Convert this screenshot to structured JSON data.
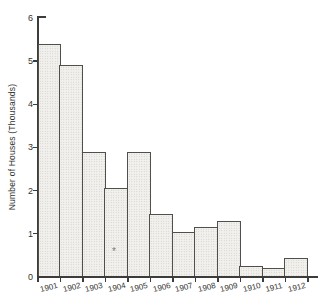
{
  "figure": {
    "background": "#ffffff",
    "asterisk_mark": "*"
  },
  "chart_data": {
    "type": "bar",
    "title": "",
    "xlabel": "",
    "ylabel": "Number of Houses (Thousands)",
    "categories": [
      "1901",
      "1902",
      "1903",
      "1904",
      "1905",
      "1906",
      "1907",
      "1908",
      "1909",
      "1910",
      "1911",
      "1912"
    ],
    "values": [
      5.4,
      4.9,
      2.9,
      2.05,
      2.9,
      1.45,
      1.05,
      1.15,
      1.3,
      0.25,
      0.2,
      0.45
    ],
    "ylim": [
      0,
      6
    ],
    "yticks": [
      0,
      1,
      2,
      3,
      4,
      5,
      6
    ],
    "grid": false,
    "legend": false,
    "bar_fill": "#f1f0ed",
    "bar_dot_color": "#c8c7c3",
    "bar_border_color": "#4f4f4c",
    "axis_color": "#3c3c3a",
    "text_color": "#333330"
  }
}
